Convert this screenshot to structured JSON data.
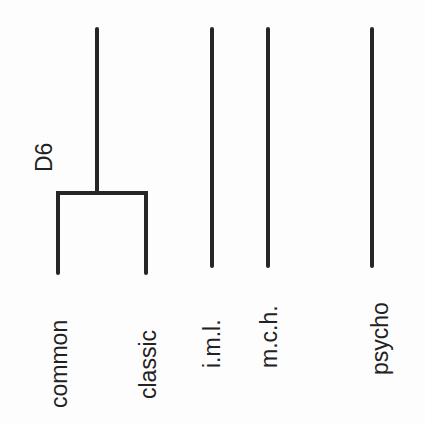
{
  "diagram": {
    "type": "dendrogram",
    "orientation": "vertical",
    "node_label": "D6",
    "colors": {
      "line": "#262626",
      "text": "#222222",
      "background": "#fdfdfd"
    },
    "leaves": [
      {
        "label": "common",
        "x": 58
      },
      {
        "label": "classic",
        "x": 146
      },
      {
        "label": "i.m.l.",
        "x": 212
      },
      {
        "label": "m.c.h.",
        "x": 268
      },
      {
        "label": "psycho",
        "x": 372
      }
    ],
    "clusters": [
      {
        "name": "D6",
        "members": [
          "common",
          "classic"
        ],
        "stem_x": 97,
        "join_y": 193
      }
    ]
  }
}
